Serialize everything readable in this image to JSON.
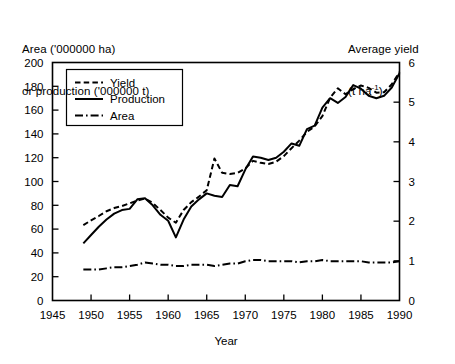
{
  "header": {
    "left_line1": "Area ('000000 ha)",
    "left_line2": "or production ('000000 t)",
    "right_line1": "Average yield",
    "right_unit_prefix": "(t ha",
    "right_unit_sup": "-1",
    "right_unit_suffix": ")"
  },
  "legend": {
    "position": "top-left-inside",
    "entries": [
      {
        "label": "Yield",
        "style": "dashed"
      },
      {
        "label": "Production",
        "style": "solid"
      },
      {
        "label": "Area",
        "style": "dash-dot"
      }
    ]
  },
  "axes": {
    "x_title": "Year",
    "x_ticks": [
      "1945",
      "1950",
      "1955",
      "1960",
      "1965",
      "1970",
      "1975",
      "1980",
      "1985",
      "1990"
    ],
    "y_left_ticks": [
      "0",
      "20",
      "40",
      "60",
      "80",
      "100",
      "120",
      "140",
      "160",
      "180",
      "200"
    ],
    "y_right_ticks": [
      "0",
      "1",
      "2",
      "3",
      "4",
      "5",
      "6"
    ]
  },
  "chart_data": {
    "type": "line",
    "title": "",
    "xlabel": "Year",
    "ylabel": "Area ('000000 ha) or production ('000000 t)",
    "y2label": "Average yield (t ha-1)",
    "xlim": [
      1945,
      1990
    ],
    "ylim": [
      0,
      200
    ],
    "y2lim": [
      0,
      6
    ],
    "xticks": [
      1945,
      1950,
      1955,
      1960,
      1965,
      1970,
      1975,
      1980,
      1985,
      1990
    ],
    "yticks": [
      0,
      20,
      40,
      60,
      80,
      100,
      120,
      140,
      160,
      180,
      200
    ],
    "y2ticks": [
      0,
      1,
      2,
      3,
      4,
      5,
      6
    ],
    "grid": false,
    "legend": [
      "Yield",
      "Production",
      "Area"
    ],
    "x": [
      1949,
      1950,
      1951,
      1952,
      1953,
      1954,
      1955,
      1956,
      1957,
      1958,
      1959,
      1960,
      1961,
      1962,
      1963,
      1964,
      1965,
      1966,
      1967,
      1968,
      1969,
      1970,
      1971,
      1972,
      1973,
      1974,
      1975,
      1976,
      1977,
      1978,
      1979,
      1980,
      1981,
      1982,
      1983,
      1984,
      1985,
      1986,
      1987,
      1988,
      1989,
      1990
    ],
    "series": [
      {
        "name": "Yield",
        "axis": "right",
        "units": "t ha-1",
        "values": [
          1.9,
          2.02,
          2.13,
          2.25,
          2.33,
          2.38,
          2.45,
          2.52,
          2.57,
          2.46,
          2.28,
          2.09,
          1.96,
          2.28,
          2.48,
          2.62,
          2.78,
          3.58,
          3.22,
          3.19,
          3.22,
          3.33,
          3.52,
          3.47,
          3.44,
          3.5,
          3.64,
          3.84,
          4.03,
          4.25,
          4.39,
          4.65,
          5.11,
          5.35,
          5.2,
          5.33,
          5.42,
          5.36,
          5.24,
          5.25,
          5.45,
          5.76
        ],
        "values_left_scale": [
          63,
          67,
          71,
          75,
          78,
          79,
          82,
          84,
          86,
          82,
          76,
          70,
          65,
          76,
          83,
          87,
          93,
          119,
          107,
          106,
          107,
          111,
          117,
          116,
          115,
          117,
          121,
          128,
          134,
          142,
          146,
          155,
          170,
          178,
          173,
          178,
          181,
          179,
          175,
          175,
          182,
          192
        ]
      },
      {
        "name": "Production",
        "axis": "left",
        "units": "'000000 t",
        "values": [
          48,
          55,
          62,
          68,
          73,
          76,
          77,
          85,
          86,
          80,
          72,
          67,
          53,
          68,
          79,
          85,
          90,
          88,
          87,
          97,
          96,
          110,
          121,
          120,
          118,
          120,
          125,
          132,
          130,
          144,
          147,
          162,
          170,
          166,
          171,
          181,
          178,
          172,
          170,
          172,
          179,
          191
        ]
      },
      {
        "name": "Area",
        "axis": "left",
        "units": "'000000 ha",
        "values": [
          26,
          26,
          26,
          27,
          28,
          28,
          29,
          30,
          32,
          31,
          30,
          30,
          29,
          29,
          30,
          30,
          30,
          29,
          30,
          31,
          31,
          33,
          34,
          34,
          33,
          33,
          33,
          33,
          32,
          33,
          33,
          34,
          33,
          33,
          33,
          33,
          33,
          32,
          32,
          32,
          32,
          33
        ]
      }
    ]
  }
}
